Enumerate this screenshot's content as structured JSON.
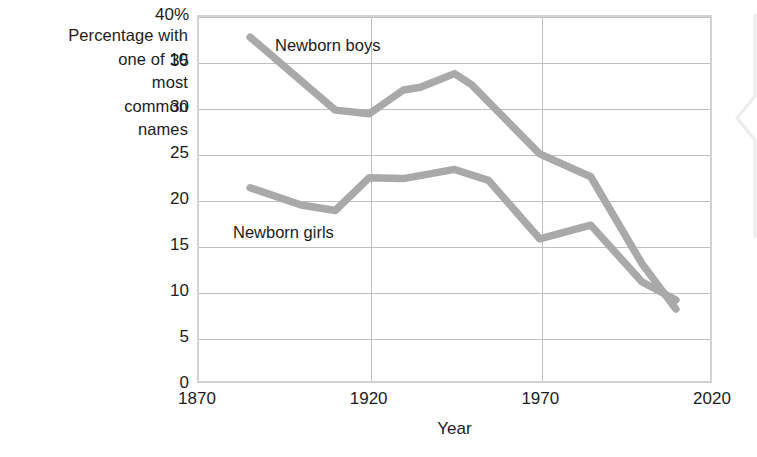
{
  "chart_data": {
    "type": "line",
    "title": "",
    "xlabel": "Year",
    "ylabel": "Percentage with one of 10 most common names",
    "ylabel_lines": [
      "Percentage with",
      "one of 10",
      "most",
      "common",
      "names"
    ],
    "xlim": [
      1870,
      2020
    ],
    "ylim": [
      0,
      40
    ],
    "grid": true,
    "legend_position": "inline-annotations",
    "xticks": [
      1870,
      1920,
      1970,
      2020
    ],
    "xtick_labels": [
      "1870",
      "1920",
      "1970",
      "2020"
    ],
    "yticks": [
      0,
      5,
      10,
      15,
      20,
      25,
      30,
      35,
      40
    ],
    "ytick_labels": [
      "0",
      "5",
      "10",
      "15",
      "20",
      "25",
      "30",
      "35",
      "40%"
    ],
    "series": [
      {
        "name": "Newborn boys",
        "label": "Newborn boys",
        "color": "#a9a9a9",
        "x": [
          1885,
          1910,
          1920,
          1930,
          1935,
          1945,
          1950,
          1970,
          1985,
          2000,
          2010
        ],
        "values": [
          37.8,
          29.8,
          29.4,
          32.0,
          32.3,
          33.8,
          32.6,
          25.0,
          22.5,
          13.0,
          8.0
        ]
      },
      {
        "name": "Newborn girls",
        "label": "Newborn girls",
        "color": "#a9a9a9",
        "x": [
          1885,
          1900,
          1910,
          1920,
          1930,
          1945,
          1955,
          1970,
          1985,
          2000,
          2010
        ],
        "values": [
          21.3,
          19.4,
          18.8,
          22.4,
          22.3,
          23.3,
          22.1,
          15.7,
          17.2,
          11.0,
          9.0
        ]
      }
    ],
    "annotations": [
      {
        "text": "Newborn boys",
        "series": "Newborn boys"
      },
      {
        "text": "Newborn girls",
        "series": "Newborn girls"
      }
    ],
    "colors": {
      "series_line": "#a9a9a9",
      "grid": "#bfbfbf",
      "frame": "#d2d2d2",
      "text": "#1c1c1c",
      "background": "#ffffff"
    }
  }
}
